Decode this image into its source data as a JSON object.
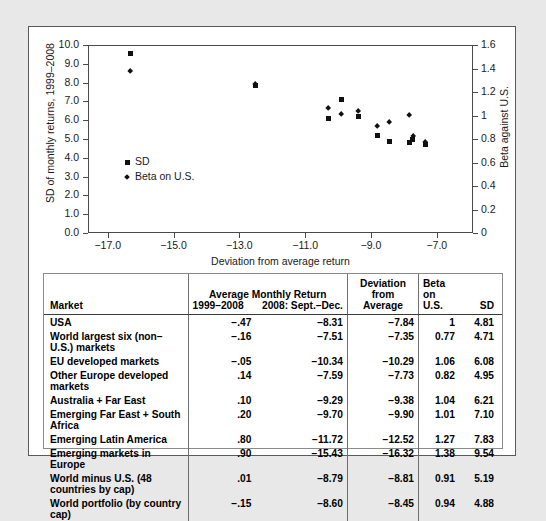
{
  "chart_data": {
    "type": "scatter",
    "title": "",
    "xlabel": "Deviation from average return",
    "ylabel_left": "SD of monthly returns, 1999–2008",
    "ylabel_right": "Beta against U.S.",
    "xlim": [
      -17.6,
      -5.9
    ],
    "ylim_left": [
      0.0,
      10.0
    ],
    "ylim_right": [
      0.0,
      1.6
    ],
    "grid": false,
    "legend_position": "inside-left",
    "xticks": [
      "−17.0",
      "−15.0",
      "−13.0",
      "−11.0",
      "−9.0",
      "−7.0"
    ],
    "xtick_values": [
      -17.0,
      -15.0,
      -13.0,
      -11.0,
      -9.0,
      -7.0
    ],
    "yticks_left": [
      "0.0",
      "1.0",
      "2.0",
      "3.0",
      "4.0",
      "5.0",
      "6.0",
      "7.0",
      "8.0",
      "9.0",
      "10.0"
    ],
    "ytick_values_left": [
      0,
      1,
      2,
      3,
      4,
      5,
      6,
      7,
      8,
      9,
      10
    ],
    "yticks_right": [
      "0",
      "0.2",
      "0.4",
      "0.6",
      "0.8",
      "1",
      "1.2",
      "1.4",
      "1.6"
    ],
    "ytick_values_right": [
      0,
      0.2,
      0.4,
      0.6,
      0.8,
      1.0,
      1.2,
      1.4,
      1.6
    ],
    "legend": [
      {
        "label": "SD",
        "marker": "square"
      },
      {
        "label": "Beta on U.S.",
        "marker": "diamond"
      }
    ],
    "x": [
      -7.84,
      -7.35,
      -10.29,
      -7.73,
      -9.38,
      -9.9,
      -12.52,
      -16.32,
      -8.81,
      -8.45
    ],
    "series": [
      {
        "name": "SD",
        "marker": "square",
        "axis": "left",
        "values": [
          4.81,
          4.71,
          6.08,
          4.95,
          6.21,
          7.1,
          7.83,
          9.54,
          5.19,
          4.88
        ]
      },
      {
        "name": "Beta on U.S.",
        "marker": "diamond",
        "axis": "right",
        "values": [
          1.0,
          0.77,
          1.06,
          0.82,
          1.04,
          1.01,
          1.27,
          1.38,
          0.91,
          0.94
        ]
      }
    ]
  },
  "table": {
    "header": {
      "market": "Market",
      "avg_group": "Average Monthly Return",
      "avg_sub1": "1999–2008",
      "avg_sub2": "2008: Sept.–Dec.",
      "dev_line1": "Deviation",
      "dev_line2": "from Average",
      "beta_line1": "Beta on",
      "beta_line2": "U.S.",
      "sd": "SD"
    },
    "rows": [
      {
        "market": "USA",
        "avg1": "−.47",
        "avg2": "−8.31",
        "dev": "−7.84",
        "beta": "1",
        "sd": "4.81"
      },
      {
        "market": "World largest six (non–U.S.) markets",
        "avg1": "−.16",
        "avg2": "−7.51",
        "dev": "−7.35",
        "beta": "0.77",
        "sd": "4.71"
      },
      {
        "market": "EU developed markets",
        "avg1": "−.05",
        "avg2": "−10.34",
        "dev": "−10.29",
        "beta": "1.06",
        "sd": "6.08"
      },
      {
        "market": "Other Europe developed markets",
        "avg1": ".14",
        "avg2": "−7.59",
        "dev": "−7.73",
        "beta": "0.82",
        "sd": "4.95"
      },
      {
        "market": "Australia + Far East",
        "avg1": ".10",
        "avg2": "−9.29",
        "dev": "−9.38",
        "beta": "1.04",
        "sd": "6.21"
      },
      {
        "market": "Emerging Far East + South Africa",
        "avg1": ".20",
        "avg2": "−9.70",
        "dev": "−9.90",
        "beta": "1.01",
        "sd": "7.10"
      },
      {
        "market": "Emerging Latin America",
        "avg1": ".80",
        "avg2": "−11.72",
        "dev": "−12.52",
        "beta": "1.27",
        "sd": "7.83"
      },
      {
        "market": "Emerging markets in Europe",
        "avg1": ".90",
        "avg2": "−15.43",
        "dev": "−16.32",
        "beta": "1.38",
        "sd": "9.54"
      },
      {
        "market": "World minus U.S. (48 countries by cap)",
        "avg1": ".01",
        "avg2": "−8.79",
        "dev": "−8.81",
        "beta": "0.91",
        "sd": "5.19"
      },
      {
        "market": "World portfolio (by country cap)",
        "avg1": "−.15",
        "avg2": "−8.60",
        "dev": "−8.45",
        "beta": "0.94",
        "sd": "4.88"
      }
    ]
  }
}
